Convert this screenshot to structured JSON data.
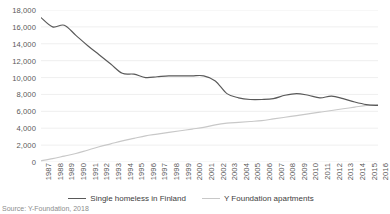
{
  "chart_data": {
    "type": "line",
    "title": "",
    "xlabel": "",
    "ylabel": "",
    "ylim": [
      0,
      18000
    ],
    "ytick_step": 2000,
    "grid": true,
    "legend_position": "bottom",
    "categories": [
      "1987",
      "1988",
      "1989",
      "1990",
      "1991",
      "1992",
      "1993",
      "1994",
      "1995",
      "1996",
      "1997",
      "1998",
      "1999",
      "2000",
      "2001",
      "2002",
      "2003",
      "2004",
      "2005",
      "2006",
      "2007",
      "2008",
      "2009",
      "2010",
      "2011",
      "2012",
      "2013",
      "2014",
      "2015",
      "2016"
    ],
    "ytick_labels": [
      "18,000",
      "16,000",
      "14,000",
      "12,000",
      "10,000",
      "8,000",
      "6,000",
      "4,000",
      "2,000",
      "0"
    ],
    "series": [
      {
        "name": "Single homeless in Finland",
        "color": "#595959",
        "values": [
          17100,
          16000,
          16200,
          15000,
          13800,
          12700,
          11600,
          10500,
          10400,
          10000,
          10100,
          10200,
          10200,
          10200,
          10200,
          9600,
          8100,
          7600,
          7400,
          7400,
          7500,
          7900,
          8100,
          7900,
          7600,
          7800,
          7500,
          7100,
          6800,
          6700
        ]
      },
      {
        "name": "Y Foundation apartments",
        "color": "#c8c8c8",
        "values": [
          150,
          400,
          700,
          1000,
          1400,
          1800,
          2150,
          2500,
          2800,
          3100,
          3300,
          3500,
          3700,
          3900,
          4100,
          4400,
          4600,
          4700,
          4800,
          4900,
          5100,
          5300,
          5500,
          5700,
          5900,
          6100,
          6300,
          6500,
          6700,
          6800
        ]
      }
    ]
  },
  "legend": {
    "items": [
      {
        "label": "Single homeless in Finland",
        "color": "#595959"
      },
      {
        "label": "Y Foundation apartments",
        "color": "#c8c8c8"
      }
    ]
  },
  "source_note": "Source: Y-Foundation, 2018"
}
